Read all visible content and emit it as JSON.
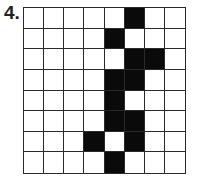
{
  "label": "4.",
  "grid": {
    "rows": 8,
    "cols": 8,
    "filled_color": "#0a0a0a",
    "empty_color": "#ffffff",
    "cells": [
      [
        0,
        0,
        0,
        0,
        0,
        1,
        0,
        0
      ],
      [
        0,
        0,
        0,
        0,
        1,
        0,
        0,
        0
      ],
      [
        0,
        0,
        0,
        0,
        0,
        1,
        1,
        0
      ],
      [
        0,
        0,
        0,
        0,
        1,
        1,
        0,
        0
      ],
      [
        0,
        0,
        0,
        0,
        1,
        0,
        0,
        0
      ],
      [
        0,
        0,
        0,
        0,
        1,
        1,
        0,
        0
      ],
      [
        0,
        0,
        0,
        1,
        0,
        1,
        0,
        0
      ],
      [
        0,
        0,
        0,
        0,
        1,
        0,
        0,
        0
      ]
    ]
  }
}
